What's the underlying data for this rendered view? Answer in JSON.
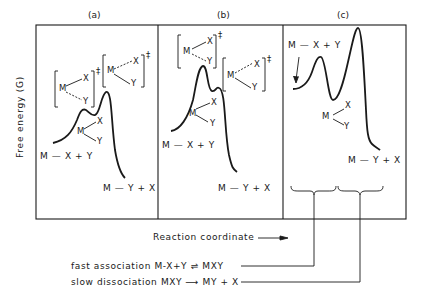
{
  "panels": [
    {
      "id": "a",
      "label": "(a)",
      "reactants": "M — X + Y",
      "products": "M — Y + X",
      "ts1": {
        "m": "M",
        "x": "X",
        "y": "Y",
        "mark": "‡"
      },
      "ts2": {
        "m": "M",
        "x": "X",
        "y": "Y",
        "mark": "‡"
      },
      "intermediate": {
        "m": "M",
        "x": "X",
        "y": "Y"
      }
    },
    {
      "id": "b",
      "label": "(b)",
      "reactants": "M — X + Y",
      "products": "M — Y + X",
      "ts1": {
        "m": "M",
        "x": "X",
        "y": "Y",
        "mark": "‡"
      },
      "ts2": {
        "m": "M",
        "x": "X",
        "y": "Y",
        "mark": "‡"
      },
      "intermediate": {
        "m": "M",
        "x": "X",
        "y": "Y"
      }
    },
    {
      "id": "c",
      "label": "(c)",
      "reactants": "M — X + Y",
      "products": "M — Y + X",
      "intermediate": {
        "m": "M",
        "x": "X",
        "y": "Y"
      }
    }
  ],
  "axes": {
    "y_label": "Free energy (G)",
    "x_label": "Reaction coordinate"
  },
  "annotations": {
    "fast": {
      "prefix": "fast association",
      "eq": "M-X+Y",
      "arrow": "⇌",
      "product": "MXY"
    },
    "slow": {
      "prefix": "slow dissociation",
      "eq": "MXY",
      "arrow": "⟶",
      "product": "MY + X"
    }
  }
}
